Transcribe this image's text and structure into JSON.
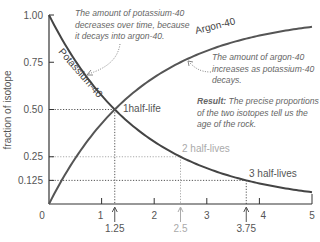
{
  "chart_data": {
    "type": "line",
    "title": "",
    "xlabel": "",
    "ylabel": "fraction of isotope",
    "xlim": [
      0,
      5
    ],
    "ylim": [
      0,
      1
    ],
    "x_ticks": [
      "0",
      "1",
      "2",
      "3",
      "4",
      "5"
    ],
    "x_tick_values": [
      0,
      1,
      2,
      3,
      4,
      5
    ],
    "y_ticks": [
      "1.00",
      "0.75",
      "0.50",
      "0.25",
      "0.125"
    ],
    "y_tick_values": [
      1.0,
      0.75,
      0.5,
      0.25,
      0.125
    ],
    "half_life": 1.25,
    "series": [
      {
        "name": "Potassium-40",
        "color": "#444444",
        "x": [
          0,
          0.5,
          1,
          1.25,
          1.5,
          2,
          2.5,
          3,
          3.5,
          3.75,
          4,
          4.5,
          5
        ],
        "values": [
          1.0,
          0.758,
          0.574,
          0.5,
          0.435,
          0.33,
          0.25,
          0.189,
          0.144,
          0.125,
          0.109,
          0.082,
          0.0625
        ]
      },
      {
        "name": "Argon-40",
        "color": "#555555",
        "x": [
          0,
          0.5,
          1,
          1.25,
          1.5,
          2,
          2.5,
          3,
          3.5,
          3.75,
          4,
          4.5,
          5
        ],
        "values": [
          0.0,
          0.242,
          0.426,
          0.5,
          0.565,
          0.67,
          0.75,
          0.811,
          0.856,
          0.875,
          0.891,
          0.918,
          0.9375
        ]
      }
    ],
    "half_life_markers": [
      {
        "label": "1half-life",
        "x": 1.25,
        "y": 0.5,
        "x_label": "1.25",
        "color": "#555555"
      },
      {
        "label": "2 half-lives",
        "x": 2.5,
        "y": 0.25,
        "x_label": "2.5",
        "color": "#aaaaaa"
      },
      {
        "label": "3 half-lives",
        "x": 3.75,
        "y": 0.125,
        "x_label": "3.75",
        "color": "#555555"
      }
    ],
    "annotations": {
      "potassium": [
        "The amount of potassium-40",
        "decreases over time, because",
        "it decays into argon-40."
      ],
      "argon": [
        "The amount of argon-40",
        "increases as potassium-40",
        "decays."
      ],
      "result_bold": "Result:",
      "result": [
        " The precise proportions",
        "of the two isotopes tell us the",
        "age of the rock."
      ]
    },
    "grid": false,
    "legend": "none"
  }
}
